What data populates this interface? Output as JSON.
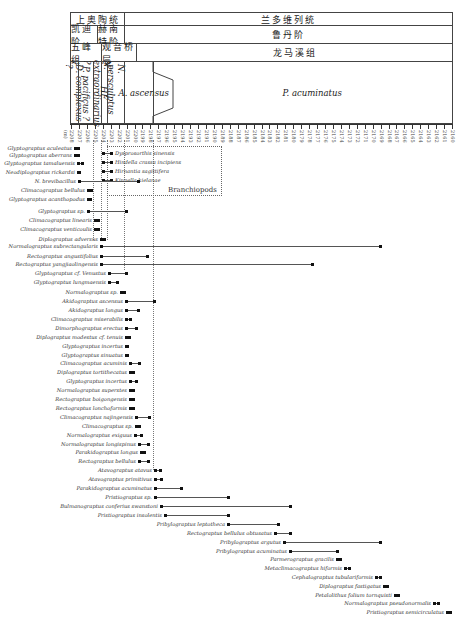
{
  "chart_data": {
    "type": "range-chart",
    "title": "",
    "xlabel": "(m)",
    "x_axis": {
      "ticks": [
        "2208",
        "2207",
        "2206",
        "2205",
        "2204",
        "2203",
        "2202",
        "2201",
        "2200",
        "2199",
        "2198",
        "2197",
        "2196",
        "2195",
        "2194",
        "2193",
        "2192",
        "2191",
        "2190",
        "2189",
        "2188",
        "2187",
        "2186",
        "2185",
        "2184",
        "2183",
        "2182",
        "2181",
        "2180",
        "2179",
        "2178",
        "2177",
        "2176",
        "2175",
        "2174",
        "2173",
        "2172",
        "2171",
        "2170",
        "2169",
        "2168",
        "2167",
        "2166",
        "2165",
        "2164",
        "2163",
        "2162",
        "2161",
        "2160"
      ],
      "unit": "(m)"
    },
    "stratigraphy": {
      "series": [
        {
          "name": "上奥陶统",
          "x0": 70,
          "x1": 124
        },
        {
          "name": "兰多维列统",
          "x0": 124,
          "x1": 452
        }
      ],
      "stages": [
        {
          "name": "凯迪阶",
          "x0": 70,
          "x1": 97
        },
        {
          "name": "赫南特阶",
          "x0": 97,
          "x1": 124
        },
        {
          "name": "鲁丹阶",
          "x0": 124,
          "x1": 452
        }
      ],
      "formations": [
        {
          "name": "五峰组",
          "x0": 70,
          "x1": 101
        },
        {
          "name": "观音桥层",
          "x0": 101,
          "x1": 136
        },
        {
          "name": "龙马溪组",
          "x0": 136,
          "x1": 452
        }
      ],
      "zones": [
        {
          "name": "D. complexus ?",
          "x0": 70,
          "x1": 78,
          "vertical": true
        },
        {
          "name": "P. pacificus ?",
          "x0": 78,
          "x1": 93,
          "vertical": true
        },
        {
          "name": "N. extraordinarius ?",
          "x0": 93,
          "x1": 101,
          "vertical": true
        },
        {
          "name": "HF",
          "x0": 101,
          "x1": 107,
          "vertical": true
        },
        {
          "name": "N. persculptus",
          "x0": 107,
          "x1": 124,
          "vertical": true
        },
        {
          "name": "A. ascensus",
          "x0": 124,
          "x1": 153,
          "vertical": false
        },
        {
          "name": "P. acuminatus",
          "x0": 153,
          "x1": 452,
          "vertical": false
        }
      ]
    },
    "brachiopods": {
      "label": "Branchiopods",
      "taxa": [
        "Dysprosorthis sinensis",
        "Hindella crassa incipiens",
        "Hirnantia sagittifera",
        "Kinnella kielanae"
      ]
    },
    "taxa": [
      {
        "name": "Glyptograptus aculeatus",
        "y": 148,
        "x0": 75,
        "x1": 78
      },
      {
        "name": "Glyptograptus aberrans",
        "y": 155,
        "x0": 75,
        "x1": 78
      },
      {
        "name": "Glyptograptus tamaluensis",
        "y": 163,
        "x0": 78,
        "x1": 82
      },
      {
        "name": "Neodiplograptus rickardsi",
        "y": 172,
        "x0": 78,
        "x1": 79
      },
      {
        "name": "N. brevibacillus",
        "y": 181,
        "x0": 79,
        "x1": 138
      },
      {
        "name": "Climacograptus bellulus",
        "y": 190,
        "x0": 88,
        "x1": 91
      },
      {
        "name": "Glyptograptus acanthopodus",
        "y": 199,
        "x0": 88,
        "x1": 90
      },
      {
        "name": "Glyptograptus sp.",
        "y": 211,
        "x0": 88,
        "x1": 126
      },
      {
        "name": "Climacograptus linearis",
        "y": 220,
        "x0": 95,
        "x1": 98
      },
      {
        "name": "Climacograptus venticoulis",
        "y": 229,
        "x0": 95,
        "x1": 98
      },
      {
        "name": "Diplograptus adversus",
        "y": 239,
        "x0": 101,
        "x1": 104
      },
      {
        "name": "Normalograptus subrectangularis",
        "y": 246,
        "x0": 101,
        "x1": 380
      },
      {
        "name": "Rectograptus angustifolius",
        "y": 256,
        "x0": 101,
        "x1": 147
      },
      {
        "name": "Rectograptus yangjiaolingensis",
        "y": 264,
        "x0": 101,
        "x1": 312
      },
      {
        "name": "Glyptograptus cf. Venustus",
        "y": 273,
        "x0": 109,
        "x1": 126
      },
      {
        "name": "Glyptograptus lungmaensis",
        "y": 282,
        "x0": 109,
        "x1": 117
      },
      {
        "name": "Normalograptus sp.",
        "y": 292,
        "x0": 121,
        "x1": 124
      },
      {
        "name": "Akidograptus ascensus",
        "y": 301,
        "x0": 126,
        "x1": 154
      },
      {
        "name": "Akidograptus longus",
        "y": 310,
        "x0": 126,
        "x1": 138
      },
      {
        "name": "Climacograptus miserabilis",
        "y": 319,
        "x0": 126,
        "x1": 130
      },
      {
        "name": "Dimorphograptus erectus",
        "y": 328,
        "x0": 126,
        "x1": 136
      },
      {
        "name": "Diplograptus modestus cf. tenuis",
        "y": 337,
        "x0": 126,
        "x1": 129
      },
      {
        "name": "Glyptograptus incertus",
        "y": 346,
        "x0": 126,
        "x1": 127
      },
      {
        "name": "Glyptograptus sinuatus",
        "y": 355,
        "x0": 126,
        "x1": 127
      },
      {
        "name": "Climacograptus acuminis",
        "y": 363,
        "x0": 130,
        "x1": 139
      },
      {
        "name": "Diplograptus tortithecatus",
        "y": 372,
        "x0": 130,
        "x1": 133
      },
      {
        "name": "Glyptograptus incertus",
        "y": 381,
        "x0": 130,
        "x1": 136
      },
      {
        "name": "Normalograptus superstes",
        "y": 390,
        "x0": 130,
        "x1": 133
      },
      {
        "name": "Rectograptus boigongensis",
        "y": 399,
        "x0": 130,
        "x1": 133
      },
      {
        "name": "Rectograptus lonchoformis",
        "y": 408,
        "x0": 130,
        "x1": 133
      },
      {
        "name": "Climacograptus najingensis",
        "y": 417,
        "x0": 136,
        "x1": 149
      },
      {
        "name": "Climacograptus sp.",
        "y": 426,
        "x0": 136,
        "x1": 139
      },
      {
        "name": "Normalograptus exiguus",
        "y": 435,
        "x0": 135,
        "x1": 141
      },
      {
        "name": "Normalograptus longispinus",
        "y": 444,
        "x0": 139,
        "x1": 148
      },
      {
        "name": "Parakidograptus longus",
        "y": 452,
        "x0": 141,
        "x1": 144
      },
      {
        "name": "Rectograptus bellulus",
        "y": 461,
        "x0": 139,
        "x1": 148
      },
      {
        "name": "Atavograptus atavus",
        "y": 470,
        "x0": 155,
        "x1": 160
      },
      {
        "name": "Atavograptus primitivus",
        "y": 479,
        "x0": 155,
        "x1": 161
      },
      {
        "name": "Parakidograptus acuminatus",
        "y": 488,
        "x0": 155,
        "x1": 181
      },
      {
        "name": "Pristiograptus sp.",
        "y": 497,
        "x0": 155,
        "x1": 228
      },
      {
        "name": "Bulmanograptus conferius swanstoni",
        "y": 506,
        "x0": 161,
        "x1": 290
      },
      {
        "name": "Pristiograptus insolentis",
        "y": 515,
        "x0": 165,
        "x1": 228
      },
      {
        "name": "Pribylograptus leptotheca",
        "y": 524,
        "x0": 228,
        "x1": 278
      },
      {
        "name": "Rectograptus bellulus obtusatus",
        "y": 533,
        "x0": 275,
        "x1": 290
      },
      {
        "name": "Pribylograptus argutus",
        "y": 542,
        "x0": 284,
        "x1": 380
      },
      {
        "name": "Pribylograptus acuminatus",
        "y": 551,
        "x0": 290,
        "x1": 337
      },
      {
        "name": "Parmerograptus gracilis",
        "y": 559,
        "x0": 337,
        "x1": 340
      },
      {
        "name": "Metaclimacograptus hiformis",
        "y": 568,
        "x0": 345,
        "x1": 349
      },
      {
        "name": "Cephalograptus tubulariformis",
        "y": 577,
        "x0": 376,
        "x1": 380
      },
      {
        "name": "Diplograptus fastigatus",
        "y": 586,
        "x0": 384,
        "x1": 387
      },
      {
        "name": "Petalolithus folium tornquisti",
        "y": 595,
        "x0": 395,
        "x1": 398
      },
      {
        "name": "Normalograptus pseudonormalis",
        "y": 603,
        "x0": 434,
        "x1": 438
      },
      {
        "name": "Pristiograptus semicirculatus",
        "y": 612,
        "x0": 447,
        "x1": 450
      }
    ]
  }
}
